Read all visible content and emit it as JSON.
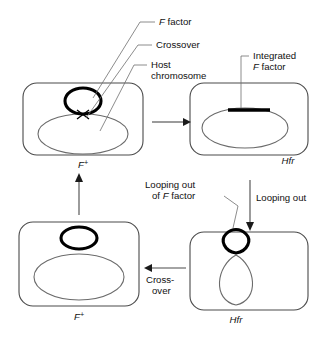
{
  "figure": {
    "colors": {
      "background": "#ffffff",
      "cell_outline": "#4a4a4a",
      "chromosome_outline": "#6b6b6b",
      "f_factor": "#000000",
      "leader_line": "#6f6f6f",
      "text": "#111111"
    }
  },
  "callouts": {
    "f_factor": {
      "italic": "F",
      "rest": " factor"
    },
    "crossover": "Crossover",
    "host_chromosome_line1": "Host",
    "host_chromosome_line2": "chromosome",
    "integrated_line1": "Integrated",
    "integrated_line2_italic": "F",
    "integrated_line2_rest": " factor",
    "looping_out_of_f_line1": "Looping out",
    "looping_out_of_f_line2_pre": "of ",
    "looping_out_of_f_line2_italic": "F",
    "looping_out_of_f_line2_rest": " factor",
    "looping_out": "Looping out",
    "crossover_wrap_line1": "Cross-",
    "crossover_wrap_line2": "over"
  },
  "cells": [
    {
      "id": "top-left",
      "state_italic": "F",
      "state_sup": "+",
      "description": "F plus cell with free F factor plasmid and host chromosome joined at a crossover"
    },
    {
      "id": "top-right",
      "state_label": "Hfr",
      "description": "Hfr cell with F factor integrated into host chromosome"
    },
    {
      "id": "bottom-right",
      "state_label": "Hfr",
      "description": "Hfr cell with F factor looping out of the chromosome"
    },
    {
      "id": "bottom-left",
      "state_italic": "F",
      "state_sup": "+",
      "description": "F plus cell with excised free F factor plasmid"
    }
  ],
  "flow": [
    {
      "id": "arrow-right-top",
      "label": "",
      "direction": "right"
    },
    {
      "id": "arrow-down-right",
      "label": "Looping out",
      "direction": "down"
    },
    {
      "id": "arrow-left-bottom",
      "label": "Cross-over",
      "direction": "left"
    },
    {
      "id": "arrow-up-left",
      "label": "",
      "direction": "up"
    }
  ]
}
